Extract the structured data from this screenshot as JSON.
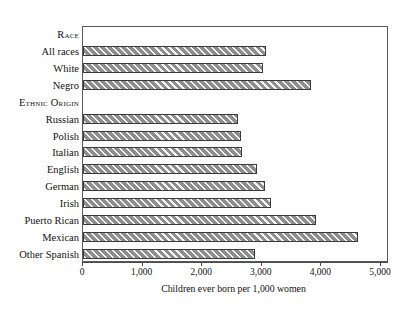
{
  "chart_data": {
    "type": "bar",
    "orientation": "horizontal",
    "title": "",
    "xlabel": "Children ever born per 1,000 women",
    "ylabel": "",
    "xlim": [
      0,
      5000
    ],
    "xticks": [
      0,
      1000,
      2000,
      3000,
      4000,
      5000
    ],
    "xtick_labels": [
      "0",
      "1,000",
      "2,000",
      "3,000",
      "4,000",
      "5,000"
    ],
    "grid": false,
    "legend": false,
    "bar_style": {
      "fill_color": "#8e8e8e",
      "hatch": "diagonal-stripes",
      "hatch_color": "#ffffff",
      "border_color": "#3a3a3a"
    },
    "rows": [
      {
        "label": "Race",
        "kind": "section",
        "value": null
      },
      {
        "label": "All races",
        "kind": "bar",
        "value": 3070
      },
      {
        "label": "White",
        "kind": "bar",
        "value": 3020
      },
      {
        "label": "Negro",
        "kind": "bar",
        "value": 3830
      },
      {
        "label": "Ethnic Origin",
        "kind": "section",
        "value": null
      },
      {
        "label": "Russian",
        "kind": "bar",
        "value": 2600
      },
      {
        "label": "Polish",
        "kind": "bar",
        "value": 2650
      },
      {
        "label": "Italian",
        "kind": "bar",
        "value": 2670
      },
      {
        "label": "English",
        "kind": "bar",
        "value": 2920
      },
      {
        "label": "German",
        "kind": "bar",
        "value": 3050
      },
      {
        "label": "Irish",
        "kind": "bar",
        "value": 3150
      },
      {
        "label": "Puerto Rican",
        "kind": "bar",
        "value": 3910
      },
      {
        "label": "Mexican",
        "kind": "bar",
        "value": 4615
      },
      {
        "label": "Other Spanish",
        "kind": "bar",
        "value": 2885
      }
    ],
    "categories": [
      "All races",
      "White",
      "Negro",
      "Russian",
      "Polish",
      "Italian",
      "English",
      "German",
      "Irish",
      "Puerto Rican",
      "Mexican",
      "Other Spanish"
    ],
    "values": [
      3070,
      3020,
      3830,
      2600,
      2650,
      2670,
      2920,
      3050,
      3150,
      3910,
      4615,
      2885
    ]
  }
}
